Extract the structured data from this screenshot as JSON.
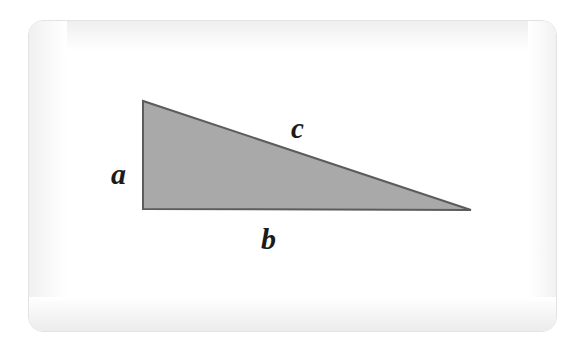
{
  "figure": {
    "kind": "right-triangle-diagram",
    "caption": "",
    "background_color": "#ffffff",
    "card": {
      "background_color": "#ffffff",
      "border_color": "#e3e3e3",
      "corner_radius_px": 15
    },
    "triangle": {
      "fill_color": "#a9a9a9",
      "stroke_color": "#5c5c5c",
      "stroke_width_px": 2,
      "right_angle_at": "bottom-left",
      "vertices": [
        {
          "name": "apex-top-left",
          "x": 114,
          "y": 80
        },
        {
          "name": "corner-bottom-left",
          "x": 114,
          "y": 188
        },
        {
          "name": "tip-bottom-right",
          "x": 442,
          "y": 189
        }
      ]
    },
    "labels": {
      "a": {
        "text": "a",
        "side": "vertical-leg",
        "x": 92,
        "y": 160
      },
      "b": {
        "text": "b",
        "side": "horizontal-leg",
        "x": 244,
        "y": 220
      },
      "c": {
        "text": "c",
        "side": "hypotenuse",
        "x": 272,
        "y": 108
      }
    }
  }
}
